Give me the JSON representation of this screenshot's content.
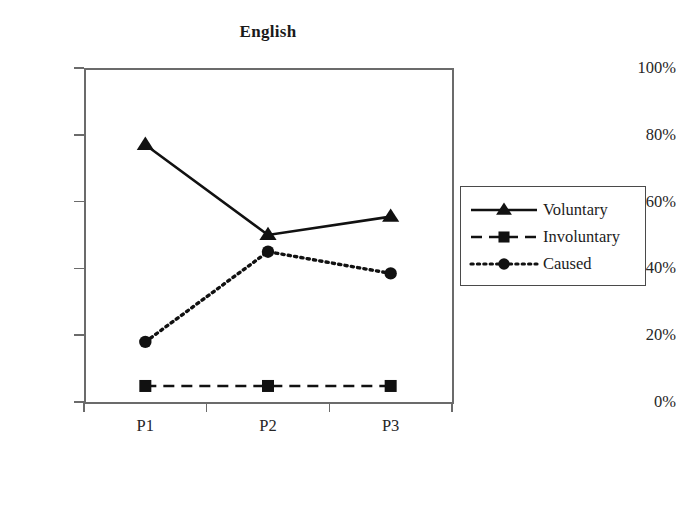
{
  "chart_data": {
    "type": "line",
    "title": "English",
    "xlabel": "",
    "ylabel": "",
    "categories": [
      "P1",
      "P2",
      "P3"
    ],
    "ylim": [
      0,
      100
    ],
    "ytick_labels": [
      "0%",
      "20%",
      "40%",
      "60%",
      "80%",
      "100%"
    ],
    "ytick_values": [
      0,
      20,
      40,
      60,
      80,
      100
    ],
    "grid": false,
    "legend_position": "right",
    "series": [
      {
        "name": "Voluntary",
        "values": [
          77,
          50,
          55.5
        ],
        "marker": "triangle",
        "line_style": "solid",
        "color": "#111111"
      },
      {
        "name": "Involuntary",
        "values": [
          4.8,
          4.8,
          4.8
        ],
        "marker": "square",
        "line_style": "dashed",
        "color": "#111111"
      },
      {
        "name": "Caused",
        "values": [
          18,
          45,
          38.5
        ],
        "marker": "circle",
        "line_style": "dotted",
        "color": "#111111"
      }
    ]
  },
  "legend": {
    "entries": [
      {
        "label": "Voluntary"
      },
      {
        "label": "Involuntary"
      },
      {
        "label": "Caused"
      }
    ]
  },
  "colors": {
    "axis": "#6b6b6b",
    "series": "#111111",
    "text": "#262626",
    "background": "#ffffff",
    "legend_border": "#4a4a4a"
  }
}
